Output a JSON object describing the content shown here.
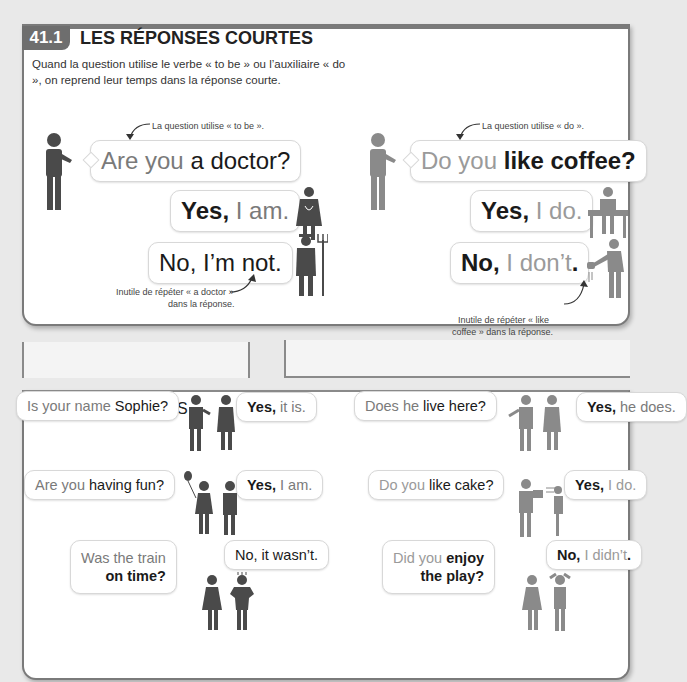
{
  "header": {
    "badge": "41.1",
    "title": "LES RÉPONSES COURTES",
    "intro": "Quand la question utilise le verbe « to be » ou l’auxiliaire « do », on reprend leur temps dans la réponse courte."
  },
  "left_example": {
    "note_top": "La question utilise « to be ».",
    "question": {
      "part1": "Are you ",
      "part2": "a doctor?"
    },
    "yes": {
      "part1": "Yes,",
      "part2": " I am."
    },
    "no": {
      "part1": "No, I’m not."
    },
    "note_bottom_1": "Inutile de répéter « a doctor »",
    "note_bottom_2": "dans la réponse."
  },
  "right_example": {
    "note_top": "La question utilise « do ».",
    "question": {
      "part1": "Do you ",
      "part2": "like coffee?"
    },
    "yes": {
      "part1": "Yes,",
      "part2": " I do."
    },
    "no": {
      "part1": "No,",
      "part2": " I don’t",
      "part3": "."
    },
    "note_bottom_1": "Inutile de répéter « like",
    "note_bottom_2": "coffee » dans la réponse."
  },
  "other_examples": {
    "title": "AUTRES EXEMPLES",
    "items": [
      {
        "q1": "Is your name ",
        "q2": "Sophie?",
        "a1": "Yes,",
        "a2": " it is."
      },
      {
        "q1": "Does he ",
        "q2": "live here?",
        "a1": "Yes,",
        "a2": " he does."
      },
      {
        "q1": "Are you ",
        "q2": "having fun?",
        "a1": "Yes,",
        "a2": " I am."
      },
      {
        "q1": "Do you ",
        "q2": "like cake?",
        "a1": "Yes,",
        "a2": " I do."
      },
      {
        "q1": "Was the train",
        "q2": "on time?",
        "a1": "No, it wasn’t.",
        "a2": ""
      },
      {
        "q1": "Did you ",
        "q2": "enjoy",
        "q3": "the play?",
        "a1": "No,",
        "a2": " I didn’t",
        "a3": "."
      }
    ]
  },
  "colors": {
    "badge": "#6e6e6e",
    "border": "#7a7a7a",
    "figure_dark": "#4a4a4a",
    "figure_light": "#8a8a8a"
  }
}
